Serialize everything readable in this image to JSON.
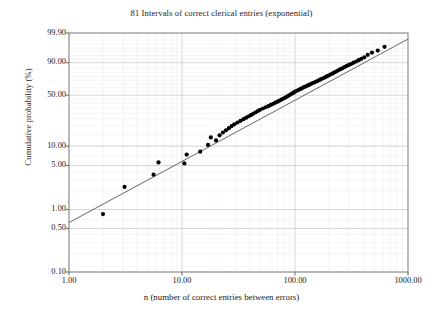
{
  "chart_data": {
    "type": "scatter",
    "title": "81 Intervals of correct clerical entries (exponential)",
    "xlabel": "n (number of correct entries between errors)",
    "ylabel": "Cumulative probability (%)",
    "xscale": "log",
    "yscale": "exponential-probability",
    "xlim": [
      1.0,
      1000.0
    ],
    "ylim": [
      0.1,
      99.9
    ],
    "grid": true,
    "legend": false,
    "xtick_labels": [
      "1.00",
      "10.00",
      "100.00",
      "1000.00"
    ],
    "xtick_values": [
      1.0,
      10.0,
      100.0,
      1000.0
    ],
    "ytick_labels": [
      "99.90",
      "90.00",
      "50.00",
      "10.00",
      "5.00",
      "1.00",
      "0.50",
      "0.10"
    ],
    "ytick_values": [
      99.9,
      90.0,
      50.0,
      10.0,
      5.0,
      1.0,
      0.5,
      0.1
    ],
    "n_points": 81,
    "series": [
      {
        "name": "Intervals of correct clerical entries",
        "marker": "filled-circle",
        "color": "#000000",
        "x": [
          2.0,
          3.1,
          5.6,
          6.2,
          10.5,
          11.0,
          14.5,
          17.0,
          18.0,
          20.0,
          21.5,
          23.0,
          24.5,
          26.0,
          27.5,
          29.0,
          31.0,
          33.0,
          35.0,
          37.0,
          39.0,
          41.0,
          43.0,
          45.0,
          47.0,
          49.0,
          52.0,
          55.0,
          58.0,
          61.0,
          64.0,
          67.0,
          70.0,
          73.0,
          76.0,
          79.0,
          82.0,
          85.0,
          88.0,
          91.0,
          94.0,
          97.0,
          100.0,
          104.0,
          108.0,
          112.0,
          116.0,
          120.0,
          125.0,
          130.0,
          135.0,
          140.0,
          146.0,
          152.0,
          158.0,
          164.0,
          170.0,
          177.0,
          184.0,
          191.0,
          198.0,
          206.0,
          214.0,
          222.0,
          231.0,
          240.0,
          250.0,
          262.0,
          274.0,
          287.0,
          300.0,
          315.0,
          331.0,
          348.0,
          366.0,
          386.0,
          410.0,
          440.0,
          480.0,
          540.0,
          620.0
        ],
        "y": [
          0.85,
          2.3,
          3.6,
          5.6,
          5.4,
          7.4,
          8.2,
          10.4,
          13.5,
          12.2,
          14.5,
          16.0,
          17.2,
          18.5,
          19.8,
          21.0,
          22.3,
          23.5,
          24.8,
          26.0,
          27.2,
          28.4,
          29.6,
          30.8,
          32.0,
          33.2,
          34.5,
          35.8,
          37.0,
          38.3,
          39.5,
          40.8,
          42.0,
          43.3,
          44.5,
          45.8,
          47.0,
          48.2,
          49.5,
          50.8,
          52.0,
          53.2,
          54.5,
          55.8,
          57.0,
          58.2,
          59.4,
          60.6,
          61.8,
          63.0,
          64.2,
          65.4,
          66.6,
          67.8,
          69.0,
          70.2,
          71.4,
          72.6,
          73.8,
          75.0,
          76.2,
          77.4,
          78.6,
          79.8,
          81.0,
          82.2,
          83.4,
          84.6,
          85.8,
          87.0,
          88.0,
          89.0,
          90.0,
          91.0,
          92.0,
          93.0,
          94.0,
          95.4,
          96.5,
          97.3,
          98.4
        ]
      }
    ],
    "fit_line": {
      "name": "exponential fit line",
      "color": "#555555",
      "endpoints": [
        {
          "x": 1.0,
          "y": 0.62
        },
        {
          "x": 1000.0,
          "y": 99.6
        }
      ]
    }
  },
  "axes": {
    "plot_left_px": 69,
    "plot_top_px": 33,
    "plot_right_px": 408,
    "plot_bottom_px": 272
  }
}
